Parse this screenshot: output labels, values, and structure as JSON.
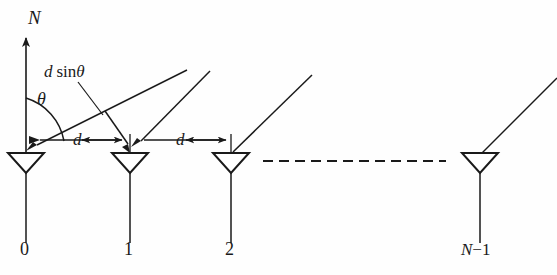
{
  "figure": {
    "background_color": "#fefefe",
    "line_color": "#1a1a1a",
    "antenna_fill": "#ffffff"
  },
  "labels": {
    "normal_axis": "N",
    "angle": "θ",
    "path_difference_var": "d",
    "path_difference_fn": "sin",
    "path_difference_angle": "θ",
    "spacing_1": "d",
    "spacing_2": "d",
    "element_0": "0",
    "element_1": "1",
    "element_2": "2",
    "element_last_var": "N",
    "element_last_suffix": "−1"
  },
  "elements": [
    {
      "name": "element-0",
      "index_label": "0",
      "center_x": 26,
      "top_y": 153
    },
    {
      "name": "element-1",
      "index_label": "1",
      "center_x": 130,
      "top_y": 153
    },
    {
      "name": "element-2",
      "index_label": "2",
      "center_x": 231,
      "top_y": 153
    },
    {
      "name": "element-n-minus-1",
      "index_label": "N−1",
      "center_x": 480,
      "top_y": 153
    }
  ],
  "geometry": {
    "antenna_half_width": 18,
    "antenna_height": 20,
    "stem_bottom_y": 243,
    "baseline_y": 153,
    "normal_axis_x": 26,
    "normal_axis_top_y": 32,
    "normal_axis_bottom_y": 153,
    "dash_line_y": 161,
    "dash_line_x1": 263,
    "dash_line_x2": 446,
    "dash_pattern": "10 6",
    "ray_angle_deg": 45,
    "dim_line_1": {
      "x1": 26,
      "x2": 130,
      "y": 140
    },
    "dim_line_2": {
      "x1": 130,
      "x2": 231,
      "y": 140
    }
  },
  "icons": {
    "antenna": "antenna-triangle-icon",
    "arrow": "arrow-head-icon",
    "dashed": "dashed-continuation-icon"
  }
}
